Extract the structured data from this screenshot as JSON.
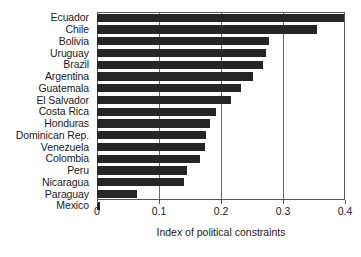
{
  "chart_data": {
    "type": "bar",
    "orientation": "horizontal",
    "title": "",
    "xlabel": "Index of political constraints",
    "ylabel": "",
    "xlim": [
      0,
      0.4
    ],
    "xticks": [
      0,
      0.1,
      0.2,
      0.3,
      0.4
    ],
    "xtick_labels": [
      "0",
      "0.1",
      "0.2",
      "0.3",
      "0.4"
    ],
    "grid": true,
    "grid_axis": "x",
    "legend": false,
    "bar_color": "#262626",
    "categories": [
      "Ecuador",
      "Chile",
      "Bolivia",
      "Uruguay",
      "Brazil",
      "Argentina",
      "Guatemala",
      "El Salvador",
      "Costa Rica",
      "Honduras",
      "Dominican Rep.",
      "Venezuela",
      "Colombia",
      "Peru",
      "Nicaragua",
      "Paraguay",
      "Mexico"
    ],
    "values": [
      0.398,
      0.355,
      0.277,
      0.272,
      0.268,
      0.252,
      0.232,
      0.216,
      0.192,
      0.182,
      0.176,
      0.174,
      0.166,
      0.145,
      0.14,
      0.065,
      0.005
    ]
  }
}
